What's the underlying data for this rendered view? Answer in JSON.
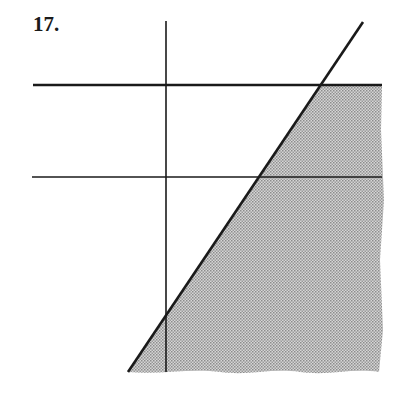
{
  "problem": {
    "number_label": "17."
  },
  "figure": {
    "vertical_line": {
      "x": 166,
      "y1": 21,
      "y2": 372
    },
    "horizontal_lines": [
      {
        "y": 85,
        "x1": 33,
        "x2": 382
      },
      {
        "y": 177,
        "x1": 32,
        "x2": 382
      }
    ],
    "boundary_line": {
      "x1": 363,
      "y1": 22,
      "x2": 128,
      "y2": 372
    },
    "shaded_region": "right of the slanted line, below the upper horizontal line",
    "colors": {
      "line": "#1a1a1a",
      "shade": "#b8b8b8"
    }
  }
}
